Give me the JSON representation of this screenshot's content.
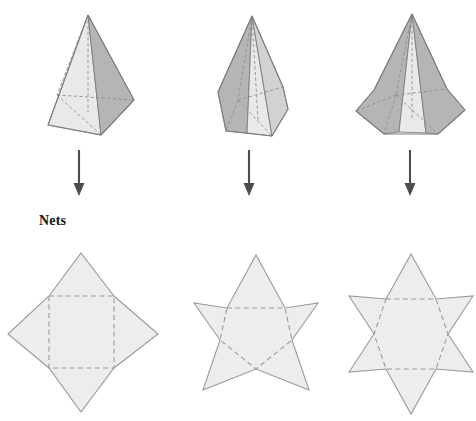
{
  "page": {
    "background_color": "#ffffff",
    "width": 476,
    "height": 421
  },
  "labels": {
    "nets": "Nets"
  },
  "palette": {
    "solid_light_face": "#e9e9e9",
    "solid_mid_face": "#d2d2d2",
    "solid_dark_face": "#b5b5b5",
    "solid_outline": "#7d7d7d",
    "hidden_edge": "#8e8e8e",
    "net_fill": "#ededed",
    "net_outline": "#9a9a9a",
    "net_hidden_edge": "#9a9a9a",
    "arrow_color": "#4d4d4d",
    "text_color": "#17171a"
  },
  "solids": [
    {
      "name": "square-pyramid",
      "label": "square pyramid",
      "base_sides": 4,
      "apex": {
        "x": 88,
        "y": 15
      },
      "outline": "88,15 48,125 101,135 134,100",
      "faces": [
        {
          "id": "front-left-face",
          "shade": "light",
          "points": "88,15 48,125 101,135"
        },
        {
          "id": "right-face",
          "shade": "dark",
          "points": "88,15 101,135 134,100"
        }
      ],
      "hidden_edges": [
        "88,15 57,95",
        "57,95 101,135",
        "57,95 134,100",
        "88,15 88,112"
      ]
    },
    {
      "name": "pentagonal-pyramid",
      "label": "pentagonal pyramid",
      "base_sides": 5,
      "apex": {
        "x": 252,
        "y": 16
      },
      "outline": "252,16 218,92 226,131 272,136 288,109 283,87",
      "faces": [
        {
          "id": "left-face",
          "shade": "dark",
          "points": "252,16 218,92 226,131 247,133"
        },
        {
          "id": "front-face",
          "shade": "light",
          "points": "252,16 247,133 272,136"
        },
        {
          "id": "right-face",
          "shade": "mid",
          "points": "252,16 272,136 288,109 283,87"
        }
      ],
      "hidden_edges": [
        "252,16 238,100",
        "238,100 226,131",
        "238,100 272,136",
        "238,100 283,87",
        "252,16 258,120"
      ]
    },
    {
      "name": "hexagonal-pyramid",
      "label": "hexagonal pyramid",
      "base_sides": 6,
      "apex": {
        "x": 412,
        "y": 14
      },
      "outline": "412,14 374,90 356,111 384,134 438,134 465,110 447,89",
      "faces": [
        {
          "id": "left-face",
          "shade": "dark",
          "points": "412,14 374,90 356,111 384,134 399,132"
        },
        {
          "id": "front-face",
          "shade": "light",
          "points": "412,14 399,132 426,133"
        },
        {
          "id": "right-face",
          "shade": "dark",
          "points": "412,14 426,133 438,134 465,110 447,89"
        }
      ],
      "hidden_edges": [
        "412,14 396,95",
        "396,95 384,134",
        "396,95 438,134",
        "396,95 447,89",
        "396,95 356,111",
        "412,14 412,118"
      ]
    }
  ],
  "arrows": [
    {
      "name": "arrow-square",
      "x": 79,
      "y_top": 150,
      "y_bottom": 196
    },
    {
      "name": "arrow-pentagonal",
      "x": 249,
      "y_top": 150,
      "y_bottom": 196
    },
    {
      "name": "arrow-hexagonal",
      "x": 410,
      "y_top": 150,
      "y_bottom": 196
    }
  ],
  "nets": [
    {
      "name": "square-pyramid-net",
      "label": "net of square pyramid",
      "points": 4,
      "star_outline": "81,253 114,296 158,334 114,368 81,412 49,368 8,334 49,296",
      "base_outline": "49,296 114,296 114,368 49,368",
      "base_shape": "square"
    },
    {
      "name": "pentagonal-pyramid-net",
      "label": "net of pentagonal pyramid",
      "points": 5,
      "star_outline": "256,255 285,308 318,303 292,340 309,390 256,369 203,390 220,340 194,303 227,308",
      "base_outline": "227,308 285,308 292,340 256,369 220,340",
      "base_shape": "pentagon"
    },
    {
      "name": "hexagonal-pyramid-net",
      "label": "net of hexagonal pyramid",
      "points": 6,
      "star_outline": "411,254 436,299 473,296 448,334 473,372 436,369 411,414 386,369 349,372 374,334 349,296 386,299",
      "base_outline": "386,299 436,299 448,334 436,369 386,369 374,334",
      "base_shape": "hexagon"
    }
  ]
}
